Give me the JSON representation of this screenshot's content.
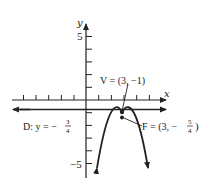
{
  "diagram": {
    "type": "parabola-graph",
    "axes": {
      "x_label": "x",
      "y_label": "y",
      "y_tick_labels": [
        {
          "value": 5,
          "text": "5"
        },
        {
          "value": -5,
          "text": "−5"
        }
      ],
      "x_range": [
        -6,
        6
      ],
      "y_range": [
        -6,
        7
      ]
    },
    "parabola": {
      "vertex": [
        3,
        -1
      ],
      "opens": "down",
      "p": -0.25
    },
    "labels": {
      "vertex": "V = (3, −1)",
      "directrix_prefix": "D: y = −",
      "directrix_num": "3",
      "directrix_den": "4",
      "focus_prefix": "F = (3, −",
      "focus_num": "5",
      "focus_den": "4",
      "focus_suffix": ")"
    },
    "directrix_y": -0.75,
    "focus": [
      3,
      -1.25
    ],
    "colors": {
      "ink": "#222222",
      "background": "#ffffff"
    }
  }
}
